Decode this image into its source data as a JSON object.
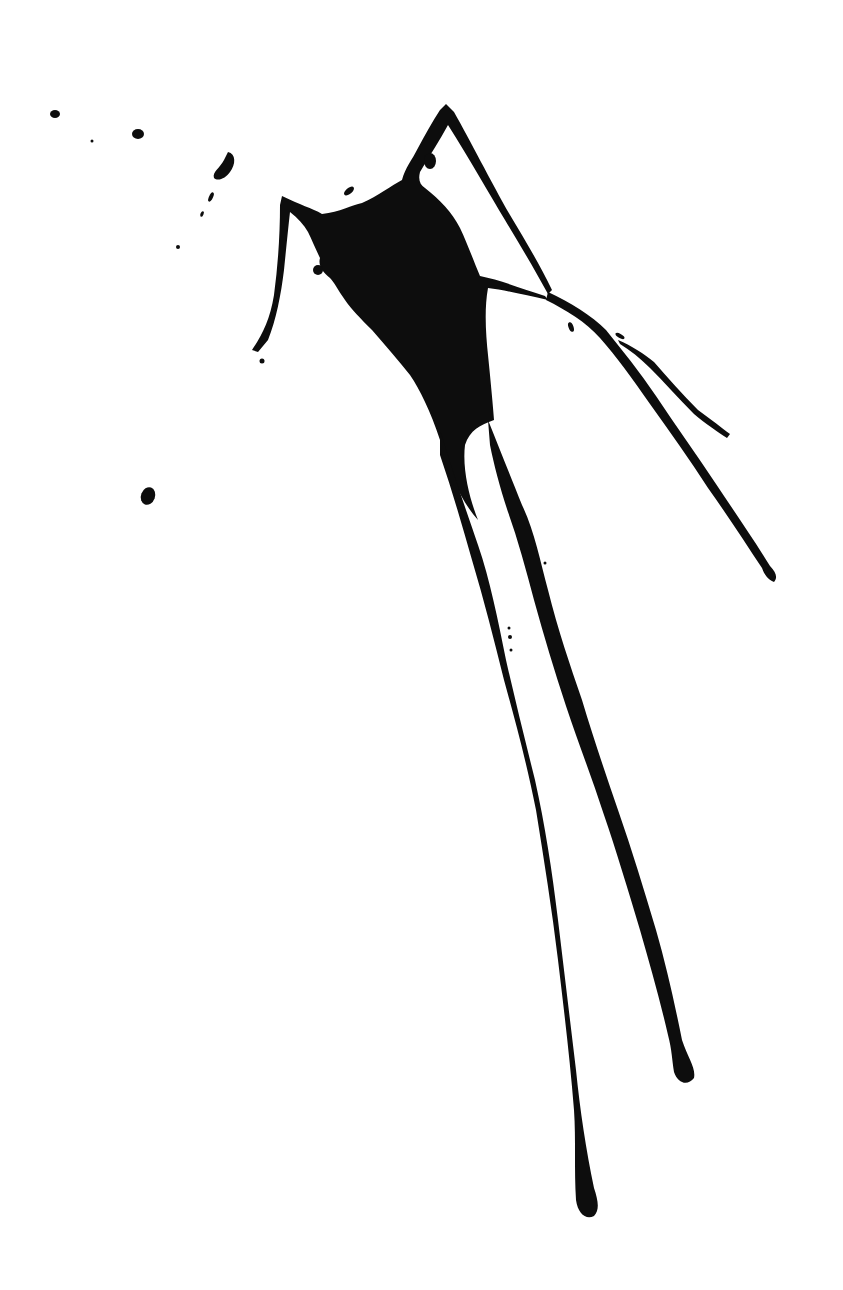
{
  "image": {
    "subject": "black ink splatter with drips on white background",
    "ink_color": "#0d0d0d",
    "background_color": "#ffffff"
  }
}
